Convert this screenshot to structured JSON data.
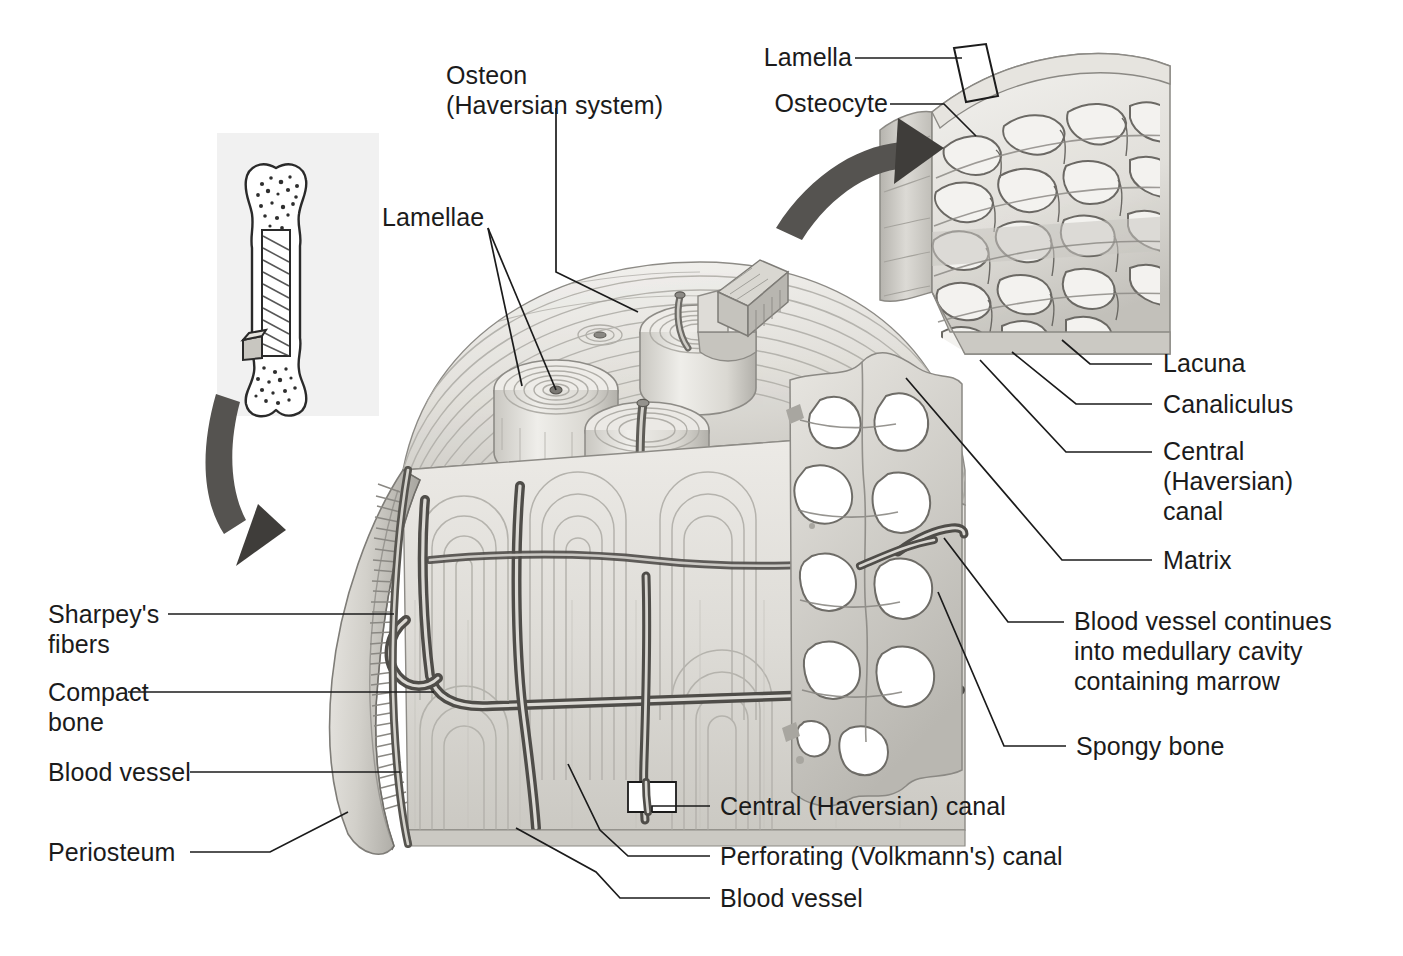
{
  "figure": {
    "style": "pencil-shaded anatomical illustration, grayscale"
  },
  "palette": {
    "background": "#ffffff",
    "text": "#1b1b1b",
    "leader_line": "#1b1b1b",
    "inset_panel": "#f1f1f1",
    "bone_light": "#f2f1ee",
    "bone_mid": "#d8d6d1",
    "bone_shadow": "#a9a7a2",
    "bone_dark": "#8a8782",
    "vessel_dark": "#4a4845",
    "arrow": "#555350"
  },
  "labels": {
    "osteon": "Osteon\n(Haversian system)",
    "lamellae": "Lamellae",
    "lamella": "Lamella",
    "osteocyte": "Osteocyte",
    "lacuna": "Lacuna",
    "canaliculus": "Canaliculus",
    "central_canal_right": "Central\n(Haversian)\ncanal",
    "matrix": "Matrix",
    "blood_vessel_medullary": "Blood vessel continues\ninto medullary cavity\ncontaining marrow",
    "spongy_bone": "Spongy bone",
    "sharpeys_fibers": "Sharpey's\nfibers",
    "compact_bone": "Compact\nbone",
    "blood_vessel_left": "Blood vessel",
    "periosteum": "Periosteum",
    "central_canal_bottom": "Central (Haversian) canal",
    "perforating_canal": "Perforating (Volkmann's) canal",
    "blood_vessel_bottom": "Blood vessel"
  },
  "structures": [
    {
      "id": "bone-inset",
      "name": "Long bone cross-section inset",
      "region": "upper-left"
    },
    {
      "id": "main-bone-block",
      "name": "Cut wedge of compact bone",
      "region": "center"
    },
    {
      "id": "osteon-columns",
      "name": "Extracted osteon cylinders",
      "region": "center-top"
    },
    {
      "id": "spongy-bone-region",
      "name": "Trabecular spongy bone network",
      "region": "center-right"
    },
    {
      "id": "periosteum-flap",
      "name": "Periosteum membrane flap",
      "region": "left"
    },
    {
      "id": "sharpeys-fiber-band",
      "name": "Sharpey's fiber bristles",
      "region": "left"
    },
    {
      "id": "magnified-osteon-wedge",
      "name": "Magnified lamellae and lacunae",
      "region": "upper-right"
    },
    {
      "id": "sample-wedge",
      "name": "Small extracted tissue wedge",
      "region": "center-top"
    }
  ]
}
